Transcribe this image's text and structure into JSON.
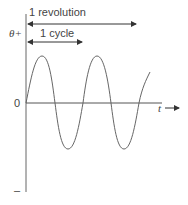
{
  "diagram": {
    "labels": {
      "revolution": "1 revolution",
      "cycle": "1 cycle",
      "y_axis_positive": "θ+",
      "origin": "0",
      "x_axis": "t",
      "y_axis_negative": "–"
    },
    "colors": {
      "line": "#555555",
      "text": "#444444",
      "background": "#ffffff"
    },
    "waveform": {
      "type": "sine",
      "cycles_shown": 2.25,
      "start_phase": "zero, rising"
    }
  }
}
